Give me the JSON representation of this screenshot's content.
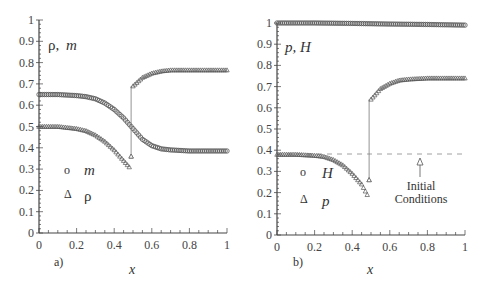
{
  "chart_data": [
    {
      "type": "scatter",
      "panel": "a)",
      "title": "",
      "ylabel": "ρ, m",
      "xlabel": "x",
      "xlim": [
        0,
        1
      ],
      "ylim": [
        0,
        1
      ],
      "xticks": [
        "0",
        "0.2",
        "0.4",
        "0.6",
        "0.8",
        "1"
      ],
      "yticks": [
        "0",
        "0.1",
        "0.2",
        "0.3",
        "0.4",
        "0.5",
        "0.6",
        "0.7",
        "0.8",
        "0.9",
        "1"
      ],
      "grid": false,
      "legend": [
        {
          "label": "m",
          "marker": "circle"
        },
        {
          "label": "ρ",
          "marker": "triangle"
        }
      ],
      "series": [
        {
          "name": "m",
          "marker": "circle",
          "x": [
            0,
            0.1,
            0.2,
            0.25,
            0.3,
            0.35,
            0.4,
            0.45,
            0.5,
            0.55,
            0.6,
            0.65,
            0.7,
            0.8,
            0.9,
            1.0
          ],
          "y": [
            0.65,
            0.65,
            0.645,
            0.64,
            0.63,
            0.61,
            0.58,
            0.54,
            0.49,
            0.44,
            0.41,
            0.395,
            0.39,
            0.385,
            0.385,
            0.385
          ]
        },
        {
          "name": "ρ",
          "marker": "triangle",
          "x": [
            0,
            0.1,
            0.2,
            0.25,
            0.3,
            0.35,
            0.4,
            0.45,
            0.48,
            0.49,
            0.5,
            0.55,
            0.6,
            0.65,
            0.7,
            0.8,
            0.9,
            1.0
          ],
          "y": [
            0.5,
            0.5,
            0.49,
            0.48,
            0.46,
            0.43,
            0.39,
            0.34,
            0.31,
            0.36,
            0.69,
            0.73,
            0.75,
            0.76,
            0.765,
            0.765,
            0.765,
            0.765
          ]
        }
      ]
    },
    {
      "type": "scatter",
      "panel": "b)",
      "title": "",
      "ylabel": "p, H",
      "xlabel": "x",
      "xlim": [
        0,
        1
      ],
      "ylim": [
        0,
        1
      ],
      "xticks": [
        "0",
        "0.2",
        "0.4",
        "0.6",
        "0.8",
        "1"
      ],
      "yticks": [
        "0",
        "0.1",
        "0.2",
        "0.3",
        "0.4",
        "0.5",
        "0.6",
        "0.7",
        "0.8",
        "0.9",
        "1"
      ],
      "grid": false,
      "legend": [
        {
          "label": "H",
          "marker": "circle"
        },
        {
          "label": "p",
          "marker": "triangle"
        }
      ],
      "annotations": [
        {
          "text": "Initial Conditions",
          "x": 0.77,
          "y": 0.38,
          "arrow": true
        },
        {
          "type": "dashed-line",
          "y": 0.38,
          "x_from": 0,
          "x_to": 1
        }
      ],
      "series": [
        {
          "name": "H",
          "marker": "circle",
          "x": [
            0,
            0.2,
            0.4,
            0.6,
            0.8,
            1.0
          ],
          "y": [
            1.0,
            1.0,
            0.998,
            0.995,
            0.993,
            0.99
          ]
        },
        {
          "name": "p",
          "marker": "triangle",
          "x": [
            0,
            0.1,
            0.2,
            0.25,
            0.3,
            0.35,
            0.4,
            0.45,
            0.48,
            0.49,
            0.5,
            0.55,
            0.6,
            0.65,
            0.7,
            0.8,
            0.9,
            1.0
          ],
          "y": [
            0.38,
            0.38,
            0.375,
            0.37,
            0.355,
            0.33,
            0.29,
            0.24,
            0.19,
            0.26,
            0.64,
            0.69,
            0.715,
            0.73,
            0.735,
            0.74,
            0.74,
            0.74
          ]
        }
      ]
    }
  ],
  "panels": {
    "a": {
      "label": "a)",
      "ylabel_rho": "ρ,",
      "ylabel_m": "m",
      "xlabel": "x",
      "legend_m": "m",
      "legend_rho": "ρ",
      "legend_circle_glyph": "o",
      "legend_triangle_glyph": "Δ"
    },
    "b": {
      "label": "b)",
      "ylabel_p": "p,",
      "ylabel_H": "H",
      "xlabel": "x",
      "legend_H": "H",
      "legend_p": "p",
      "legend_circle_glyph": "o",
      "legend_triangle_glyph": "Δ",
      "annotation_line1": "Initial",
      "annotation_line2": "Conditions"
    }
  },
  "colors": {
    "axis": "#444444",
    "marker": "#555555",
    "marker_fill": "#ffffff",
    "dashed": "#888888"
  }
}
